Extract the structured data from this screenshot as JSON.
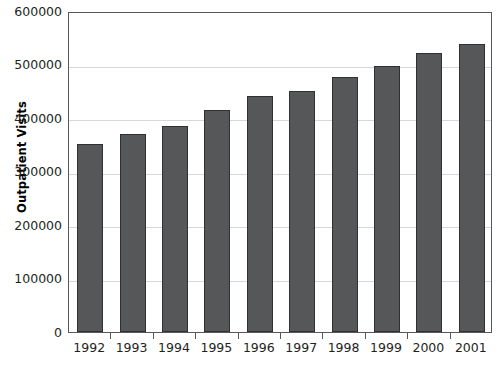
{
  "chart_data": {
    "type": "bar",
    "title": "",
    "xlabel": "",
    "ylabel": "Outpatient Visits",
    "categories": [
      "1992",
      "1993",
      "1994",
      "1995",
      "1996",
      "1997",
      "1998",
      "1999",
      "2000",
      "2001"
    ],
    "values": [
      351000,
      370000,
      385000,
      415000,
      441000,
      451000,
      477000,
      497000,
      521000,
      539000
    ],
    "ylim": [
      0,
      600000
    ],
    "ytick_values": [
      0,
      100000,
      200000,
      300000,
      400000,
      500000,
      600000
    ],
    "ytick_labels": [
      "0",
      "100000",
      "200000",
      "300000",
      "400000",
      "500000",
      "600000"
    ],
    "grid": true,
    "legend": false,
    "legend_position": "none",
    "series": [
      {
        "name": "Outpatient Visits",
        "values": [
          351000,
          370000,
          385000,
          415000,
          441000,
          451000,
          477000,
          497000,
          521000,
          539000
        ]
      }
    ]
  },
  "style": {
    "bar_fill": "#555759",
    "bar_border": "#2f3031",
    "gridline_color": "#d7d7d9",
    "axis_color": "#58585a",
    "text_color": "#231f20",
    "background": "#ffffff"
  }
}
